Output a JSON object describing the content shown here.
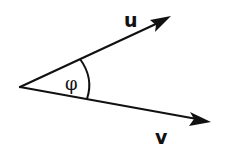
{
  "diagram": {
    "colors": {
      "stroke": "#111111",
      "background": "#ffffff"
    },
    "origin": {
      "x": 20,
      "y": 87
    },
    "vectors": [
      {
        "id": "u",
        "label": "u",
        "tip": {
          "x": 171,
          "y": 16
        }
      },
      {
        "id": "v",
        "label": "v",
        "tip": {
          "x": 211,
          "y": 122
        }
      }
    ],
    "angle": {
      "label": "φ",
      "between": [
        "u",
        "v"
      ]
    }
  }
}
